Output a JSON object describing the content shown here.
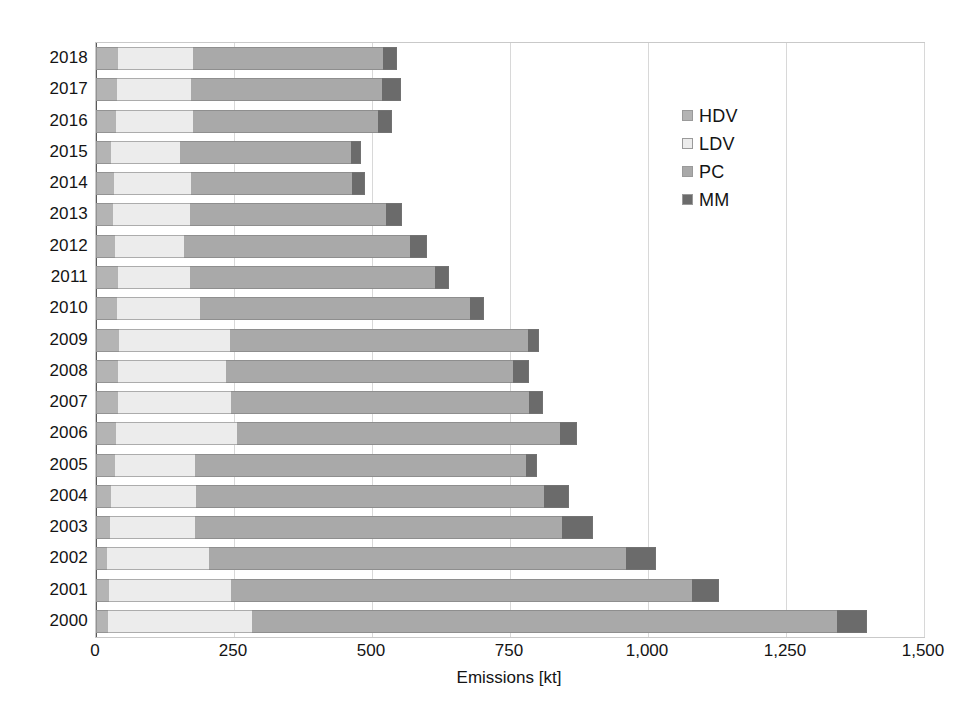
{
  "chart_data": {
    "type": "bar",
    "orientation": "horizontal",
    "stacked": true,
    "title": "",
    "xlabel": "Emissions [kt]",
    "ylabel": "",
    "xlim": [
      0,
      1500
    ],
    "xticks": [
      0,
      250,
      500,
      750,
      1000,
      1250,
      1500
    ],
    "xtick_labels": [
      "0",
      "250",
      "500",
      "750",
      "1,000",
      "1,250",
      "1,500"
    ],
    "grid": true,
    "legend_position": "upper right",
    "categories": [
      "2018",
      "2017",
      "2016",
      "2015",
      "2014",
      "2013",
      "2012",
      "2011",
      "2010",
      "2009",
      "2008",
      "2007",
      "2006",
      "2005",
      "2004",
      "2003",
      "2002",
      "2001",
      "2000"
    ],
    "series": [
      {
        "name": "HDV",
        "color": "#b4b4b4",
        "values": [
          40,
          38,
          36,
          27,
          33,
          30,
          34,
          40,
          38,
          42,
          40,
          40,
          36,
          34,
          27,
          25,
          20,
          24,
          22
        ]
      },
      {
        "name": "LDV",
        "color": "#ececec",
        "values": [
          135,
          135,
          140,
          125,
          140,
          140,
          125,
          130,
          150,
          200,
          195,
          205,
          220,
          145,
          155,
          155,
          185,
          220,
          260
        ]
      },
      {
        "name": "PC",
        "color": "#a9a9a9",
        "values": [
          345,
          345,
          335,
          310,
          290,
          355,
          410,
          445,
          490,
          540,
          520,
          540,
          585,
          600,
          630,
          665,
          755,
          835,
          1060
        ]
      },
      {
        "name": "MM",
        "color": "#6b6b6b",
        "values": [
          25,
          35,
          25,
          18,
          25,
          30,
          30,
          25,
          25,
          20,
          30,
          25,
          30,
          20,
          45,
          55,
          55,
          50,
          55
        ]
      }
    ],
    "totals": [
      545,
      553,
      536,
      480,
      488,
      555,
      599,
      640,
      703,
      802,
      785,
      810,
      871,
      799,
      857,
      900,
      1015,
      1129,
      1397
    ]
  },
  "legend": {
    "items": [
      {
        "label": "HDV",
        "color": "#b4b4b4"
      },
      {
        "label": "LDV",
        "color": "#ececec"
      },
      {
        "label": "PC",
        "color": "#a9a9a9"
      },
      {
        "label": "MM",
        "color": "#6b6b6b"
      }
    ]
  },
  "axis": {
    "x_title": "Emissions [kt]"
  }
}
